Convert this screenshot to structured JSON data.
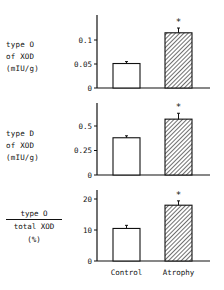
{
  "chart_data": [
    {
      "type": "bar",
      "title": "",
      "ylabel": [
        "type O",
        "of XOD",
        "(mIU/g)"
      ],
      "categories": [
        "Control",
        "Atrophy"
      ],
      "values": [
        0.051,
        0.115
      ],
      "errors": [
        0.004,
        0.01
      ],
      "significant": [
        false,
        true
      ],
      "yticks": [
        0,
        0.05,
        0.1
      ],
      "ytick_labels": [
        "0",
        "0.05",
        "0.1"
      ],
      "ylim": [
        0,
        0.15
      ],
      "fills": [
        "white",
        "hatched"
      ]
    },
    {
      "type": "bar",
      "title": "",
      "ylabel": [
        "type D",
        "of XOD",
        "(mIU/g)"
      ],
      "categories": [
        "Control",
        "Atrophy"
      ],
      "values": [
        0.38,
        0.57
      ],
      "errors": [
        0.02,
        0.06
      ],
      "significant": [
        false,
        true
      ],
      "yticks": [
        0,
        0.25,
        0.5
      ],
      "ytick_labels": [
        "0",
        "0.25",
        "0.5"
      ],
      "ylim": [
        0,
        0.72
      ],
      "fills": [
        "white",
        "hatched"
      ]
    },
    {
      "type": "bar",
      "title": "",
      "ylabel": [
        "type O",
        "total XOD",
        "(%)"
      ],
      "ylabel_is_fraction": true,
      "categories": [
        "Control",
        "Atrophy"
      ],
      "values": [
        10.5,
        18
      ],
      "errors": [
        1,
        1.4
      ],
      "significant": [
        false,
        true
      ],
      "yticks": [
        0,
        10,
        20
      ],
      "ytick_labels": [
        "0",
        "10",
        "20"
      ],
      "ylim": [
        0,
        23
      ],
      "fills": [
        "white",
        "hatched"
      ]
    }
  ],
  "labels": {
    "p1": [
      "type O",
      "of XOD",
      "(mIU/g)"
    ],
    "p2": [
      "type D",
      "of XOD",
      "(mIU/g)"
    ],
    "p3_num": "type O",
    "p3_den": "total XOD",
    "p3_unit": "(%)",
    "x_control": "Control",
    "x_atrophy": "Atrophy",
    "sig_marker": "*"
  }
}
